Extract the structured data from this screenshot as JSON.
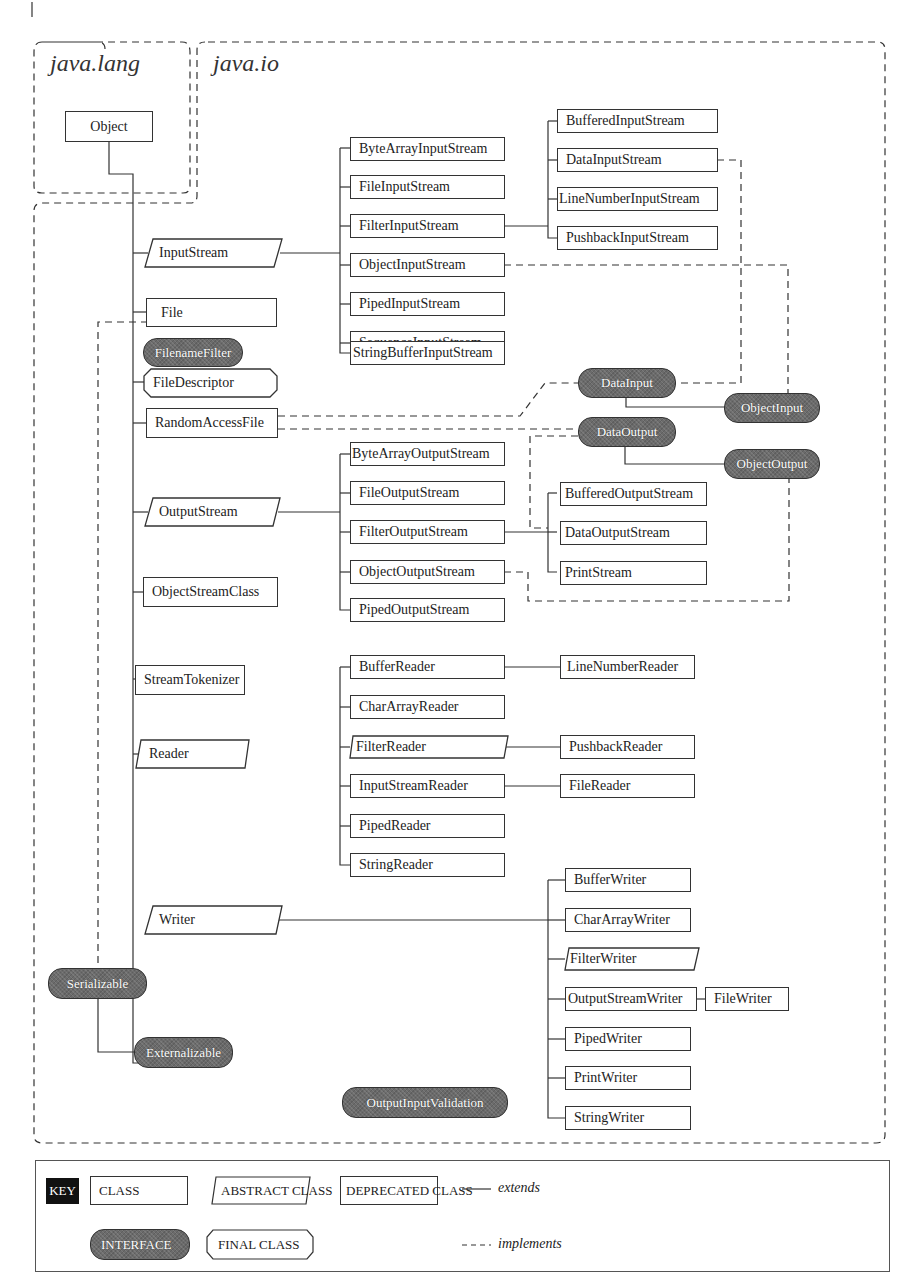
{
  "packages": {
    "lang": "java.lang",
    "io": "java.io"
  },
  "nodes": {
    "object": "Object",
    "inputstream": "InputStream",
    "file": "File",
    "filenamefilter": "FilenameFilter",
    "filedescriptor": "FileDescriptor",
    "randomaccessfile": "RandomAccessFile",
    "outputstream": "OutputStream",
    "objectstreamclass": "ObjectStreamClass",
    "streamtokenizer": "StreamTokenizer",
    "reader": "Reader",
    "writer": "Writer",
    "serializable": "Serializable",
    "externalizable": "Externalizable",
    "outputinputvalidation": "OutputInputValidation",
    "bytearrayinputstream": "ByteArrayInputStream",
    "fileinputstream": "FileInputStream",
    "filterinputstream": "FilterInputStream",
    "objectinputstream": "ObjectInputStream",
    "pipedinputstream": "PipedInputStream",
    "sequenceinputstream": "SequenceInputStream",
    "stringbufferinputstream": "StringBufferInputStream",
    "bufferedinputstream": "BufferedInputStream",
    "datainputstream": "DataInputStream",
    "linenumberinputstream": "LineNumberInputStream",
    "pushbackinputstream": "PushbackInputStream",
    "datainput": "DataInput",
    "objectinput": "ObjectInput",
    "dataoutput": "DataOutput",
    "objectoutput": "ObjectOutput",
    "bytearrayoutputstream": "ByteArrayOutputStream",
    "fileoutputstream": "FileOutputStream",
    "filteroutputstream": "FilterOutputStream",
    "objectoutputstream": "ObjectOutputStream",
    "pipedoutputstream": "PipedOutputStream",
    "bufferedoutputstream": "BufferedOutputStream",
    "dataoutputstream": "DataOutputStream",
    "printstream": "PrintStream",
    "bufferreader": "BufferReader",
    "chararrayreader": "CharArrayReader",
    "filterreader": "FilterReader",
    "inputstreamreader": "InputStreamReader",
    "pipedreader": "PipedReader",
    "stringreader": "StringReader",
    "linenumberreader": "LineNumberReader",
    "pushbackreader": "PushbackReader",
    "filereader": "FileReader",
    "bufferwriter": "BufferWriter",
    "chararraywriter": "CharArrayWriter",
    "filterwriter": "FilterWriter",
    "outputstreamwriter": "OutputStreamWriter",
    "filewriter": "FileWriter",
    "pipedwriter": "PipedWriter",
    "printwriter": "PrintWriter",
    "stringwriter": "StringWriter"
  },
  "key": {
    "title": "KEY",
    "class": "CLASS",
    "abstract_class": "ABSTRACT CLASS",
    "deprecated_class": "DEPRECATED CLASS",
    "interface": "INTERFACE",
    "final_class": "FINAL CLASS",
    "extends": "extends",
    "implements": "implements"
  },
  "colors": {
    "line": "#333333",
    "interface_fill": "#6b6b6b",
    "key_bg": "#111111"
  }
}
